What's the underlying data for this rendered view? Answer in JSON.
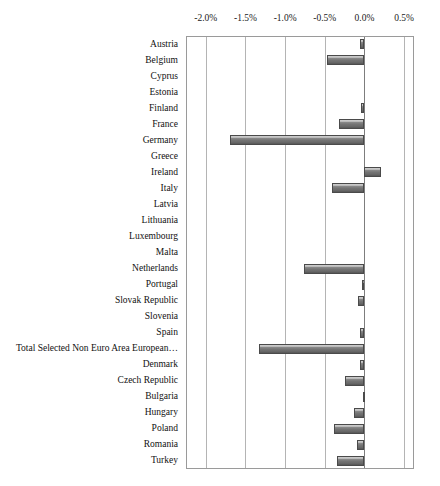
{
  "chart_data": {
    "type": "bar",
    "orientation": "horizontal",
    "title": "",
    "subtitle": "",
    "xlabel": "",
    "ylabel": "",
    "xlim": [
      -2.25,
      0.625
    ],
    "xtick_labels": [
      "-2.0%",
      "-1.5%",
      "-1.0%",
      "-0.5%",
      "0.0%",
      "0.5%"
    ],
    "xtick_values": [
      -2.0,
      -1.5,
      -1.0,
      -0.5,
      0.0,
      0.5
    ],
    "grid": "vertical",
    "legend": "none",
    "value_unit": "%",
    "categories": [
      "Austria",
      "Belgium",
      "Cyprus",
      "Estonia",
      "Finland",
      "France",
      "Germany",
      "Greece",
      "Ireland",
      "Italy",
      "Latvia",
      "Lithuania",
      "Luxembourg",
      "Malta",
      "Netherlands",
      "Portugal",
      "Slovak Republic",
      "Slovenia",
      "Spain",
      "Total Selected Non Euro Area European…",
      "Denmark",
      "Czech Republic",
      "Bulgaria",
      "Hungary",
      "Poland",
      "Romania",
      "Turkey"
    ],
    "values": [
      -0.05,
      -0.47,
      0.0,
      0.0,
      -0.04,
      -0.32,
      -1.69,
      0.0,
      0.21,
      -0.41,
      0.0,
      0.0,
      0.0,
      0.0,
      -0.76,
      -0.03,
      -0.08,
      0.0,
      -0.06,
      -1.33,
      -0.05,
      -0.25,
      -0.02,
      -0.13,
      -0.38,
      -0.1,
      -0.35
    ]
  },
  "colors": {
    "bar_fill_light": "#b9b9b9",
    "bar_fill_dark": "#565656",
    "bar_border": "#4a4a4a",
    "gridline": "#b4b4b4",
    "axis": "#9a9a9a",
    "zero_line": "#7d7d7d",
    "background": "#ffffff",
    "text": "#1a1a1a"
  },
  "footer": {
    "fragment_text": ""
  }
}
